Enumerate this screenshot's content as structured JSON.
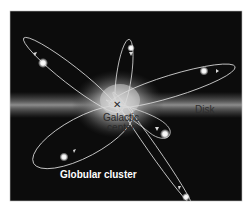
{
  "figure": {
    "background_color": "#0c0c0c",
    "disk_color": "#8a8a8a",
    "orbit_color": "#d9d9d9",
    "cluster_color": "#ffffff"
  },
  "labels": {
    "galactic_center_line1": "Galactic",
    "galactic_center_line2": "center",
    "disk": "Disk",
    "globular_cluster": "Globular cluster"
  },
  "markers": {
    "center_mark": "✕"
  },
  "clusters": [
    {
      "name": "upper-left",
      "x": 43,
      "y": 63
    },
    {
      "name": "upper-middle",
      "x": 131,
      "y": 48
    },
    {
      "name": "upper-right",
      "x": 204,
      "y": 71
    },
    {
      "name": "lower-left",
      "x": 64,
      "y": 157
    },
    {
      "name": "right-middle",
      "x": 165,
      "y": 134
    },
    {
      "name": "bottom-right",
      "x": 186,
      "y": 197
    }
  ]
}
